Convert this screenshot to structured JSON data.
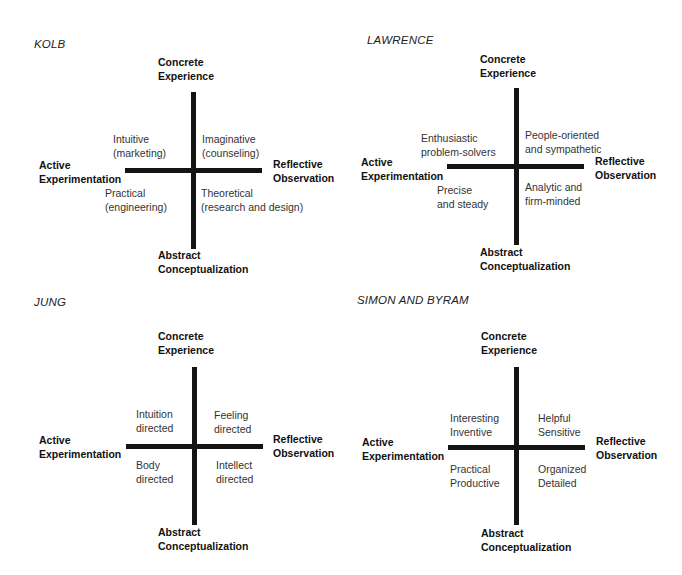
{
  "axes": {
    "top": [
      "Concrete",
      "Experience"
    ],
    "bottom": [
      "Abstract",
      "Conceptualization"
    ],
    "left": [
      "Active",
      "Experimentation"
    ],
    "right": [
      "Reflective",
      "Observation"
    ]
  },
  "diagrams": [
    {
      "title": "KOLB",
      "quadrants": {
        "top_left": [
          "Intuitive",
          "(marketing)"
        ],
        "top_right": [
          "Imaginative",
          "(counseling)"
        ],
        "bottom_left": [
          "Practical",
          "(engineering)"
        ],
        "bottom_right": [
          "Theoretical",
          "(research and design)"
        ]
      }
    },
    {
      "title": "LAWRENCE",
      "quadrants": {
        "top_left": [
          "Enthusiastic",
          "problem-solvers"
        ],
        "top_right": [
          "People-oriented",
          "and sympathetic"
        ],
        "bottom_left": [
          "Precise",
          "and steady"
        ],
        "bottom_right": [
          "Analytic and",
          "firm-minded"
        ]
      }
    },
    {
      "title": "JUNG",
      "quadrants": {
        "top_left": [
          "Intuition",
          "directed"
        ],
        "top_right": [
          "Feeling",
          "directed"
        ],
        "bottom_left": [
          "Body",
          "directed"
        ],
        "bottom_right": [
          "Intellect",
          "directed"
        ]
      }
    },
    {
      "title": "SIMON AND BYRAM",
      "quadrants": {
        "top_left": [
          "Interesting",
          "Inventive"
        ],
        "top_right": [
          "Helpful",
          "Sensitive"
        ],
        "bottom_left": [
          "Practical",
          "Productive"
        ],
        "bottom_right": [
          "Organized",
          "Detailed"
        ]
      }
    }
  ]
}
